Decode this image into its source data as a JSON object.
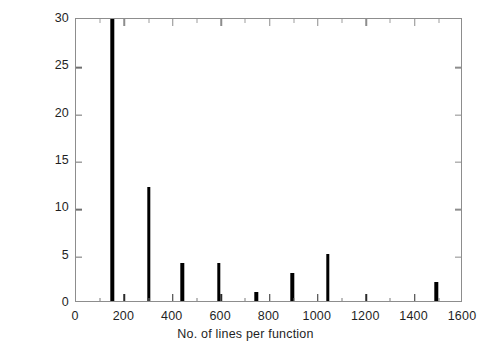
{
  "chart_data": {
    "type": "bar",
    "title": "",
    "subtitle": "",
    "xlabel": "No. of lines per function",
    "ylabel": "Frequency",
    "xlim": [
      0,
      1600
    ],
    "ylim": [
      0,
      30
    ],
    "grid": false,
    "legend": null,
    "xticks": [
      0,
      200,
      400,
      600,
      800,
      1000,
      1200,
      1400,
      1600
    ],
    "xtick_labels": [
      "0",
      "200",
      "400",
      "600",
      "800",
      "1000",
      "1200",
      "1400",
      "1600"
    ],
    "xminor_ticks": [
      100,
      300,
      500,
      700,
      900,
      1100,
      1300,
      1500
    ],
    "yticks": [
      0,
      5,
      10,
      15,
      20,
      25,
      30
    ],
    "ytick_labels": [
      "0",
      "5",
      "10",
      "15",
      "20",
      "25",
      "30"
    ],
    "bar_color": "#000000",
    "frame_color": "#8d8d8d",
    "background": "#ffffff",
    "bar_width_units": 14,
    "note_clipped": "Bar at x=150 exceeds the y-axis maximum of 30 and is clipped at the top of the axes.",
    "x": [
      150,
      300,
      440,
      590,
      745,
      895,
      1040,
      1490
    ],
    "values": [
      30,
      12,
      4,
      4,
      1,
      3,
      5,
      2
    ],
    "points": [
      {
        "x": 150,
        "y": 30,
        "clipped": true
      },
      {
        "x": 300,
        "y": 12,
        "clipped": false
      },
      {
        "x": 440,
        "y": 4,
        "clipped": false
      },
      {
        "x": 590,
        "y": 4,
        "clipped": false
      },
      {
        "x": 745,
        "y": 1,
        "clipped": false
      },
      {
        "x": 895,
        "y": 3,
        "clipped": false
      },
      {
        "x": 1040,
        "y": 5,
        "clipped": false
      },
      {
        "x": 1490,
        "y": 2,
        "clipped": false
      }
    ]
  }
}
